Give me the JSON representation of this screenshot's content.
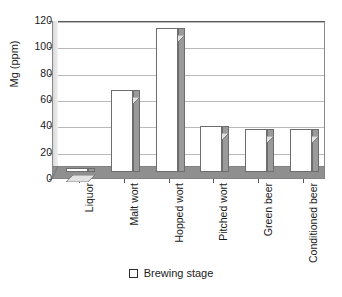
{
  "chart_data": {
    "type": "bar",
    "title": "",
    "subtitle": "",
    "xlabel": "",
    "ylabel": "Mg (ppm)",
    "categories": [
      "Liquor",
      "Malt wort",
      "Hopped wort",
      "Pitched wort",
      "Green beer",
      "Conditioned beer"
    ],
    "values": [
      3,
      62,
      109,
      35,
      33,
      33
    ],
    "series": [
      {
        "name": "Brewing stage",
        "values": [
          3,
          62,
          109,
          35,
          33,
          33
        ]
      }
    ],
    "ylim": [
      0,
      120
    ],
    "ytick_labels": [
      "0",
      "20",
      "40",
      "60",
      "80",
      "100",
      "120"
    ],
    "ytick_values": [
      0,
      20,
      40,
      60,
      80,
      100,
      120
    ],
    "grid": "horizontal",
    "legend_position": "bottom",
    "legend_entries": [
      "Brewing stage"
    ],
    "style": "3d-column",
    "colors": {
      "bar_front": "#ffffff",
      "bar_side": "#9a9a9a",
      "bar_top": "#e2e2e2",
      "bar_outline": "#6d6d6d",
      "floor": "#8f8f8f",
      "gridline": "#b9b9b9",
      "axis": "#4a4a4a",
      "text": "#1a1a1a",
      "background": "#ffffff"
    }
  },
  "legend": {
    "swatch_icon": "square-outline-icon",
    "label": "Brewing stage"
  }
}
